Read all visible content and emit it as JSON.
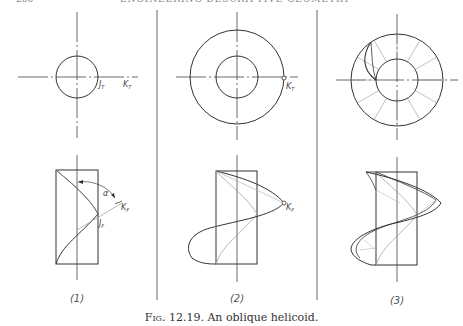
{
  "page": {
    "header_page_number": "266",
    "header_running_title": "ENGINEERING DESCRIPTIVE GEOMETRY"
  },
  "figure": {
    "caption_prefix": "Fig. 12.19.",
    "caption_text": "An oblique helicoid.",
    "panels": [
      {
        "id": 1,
        "label": "(1)",
        "top_view_labels": [
          "J_T",
          "K_T"
        ],
        "front_view_labels": [
          "α",
          "K_F",
          "J_F"
        ]
      },
      {
        "id": 2,
        "label": "(2)",
        "top_view_labels": [
          "K_T"
        ],
        "front_view_labels": [
          "K_F"
        ]
      },
      {
        "id": 3,
        "label": "(3)",
        "top_view_labels": [],
        "front_view_labels": []
      }
    ]
  },
  "labels": {
    "jt": "J",
    "kt": "K",
    "sub_t": "T",
    "jf": "J",
    "kf": "K",
    "sub_f": "F",
    "alpha": "α"
  },
  "colors": {
    "line": "#333333",
    "thin_line": "#999999",
    "divider": "#666666"
  }
}
